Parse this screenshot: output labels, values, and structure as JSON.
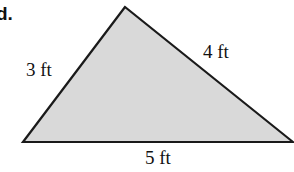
{
  "problem": {
    "label": "d."
  },
  "figure": {
    "shape": "triangle",
    "fill_color": "#d9d9d9",
    "stroke_color": "#1a1a1a",
    "vertices": {
      "top": [
        125,
        7
      ],
      "bottom_left": [
        23,
        142
      ],
      "bottom_right": [
        293,
        142
      ]
    },
    "sides": {
      "left": "3 ft",
      "right": "4 ft",
      "bottom": "5 ft"
    }
  }
}
